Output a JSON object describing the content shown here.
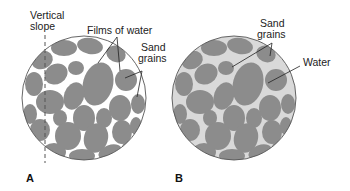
{
  "figure": {
    "panel_a": {
      "letter": "A",
      "labels": {
        "vertical_slope_1": "Vertical",
        "vertical_slope_2": "slope",
        "films_of_water": "Films of water",
        "sand_grains_1": "Sand",
        "sand_grains_2": "grains"
      }
    },
    "panel_b": {
      "letter": "B",
      "labels": {
        "sand_grains_1": "Sand",
        "sand_grains_2": "grains",
        "water": "Water"
      }
    },
    "colors": {
      "grain": "#8c8c8c",
      "water_fill_b": "#d9d9d9",
      "background_a": "#ffffff",
      "outline": "#444444",
      "leader": "#222222"
    }
  }
}
